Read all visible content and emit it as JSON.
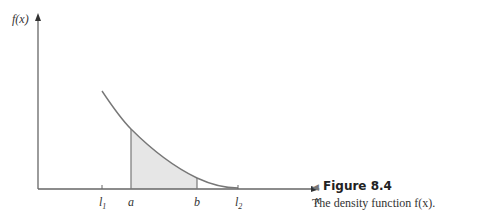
{
  "figure": {
    "y_axis_label": "f(x)",
    "x_axis_label": "x",
    "ticks": [
      {
        "label": "l",
        "sub": "1",
        "x": 102
      },
      {
        "label": "a",
        "sub": "",
        "x": 131
      },
      {
        "label": "b",
        "sub": "",
        "x": 197
      },
      {
        "label": "l",
        "sub": "2",
        "x": 238
      }
    ],
    "shaded_region": {
      "from": "a",
      "to": "b",
      "color": "#e6e6e6"
    },
    "curve_color": "#777777",
    "axis_color": "#666666"
  },
  "caption": {
    "marker": "◀",
    "title": "Figure 8.4",
    "description": "The density function f(x)."
  }
}
